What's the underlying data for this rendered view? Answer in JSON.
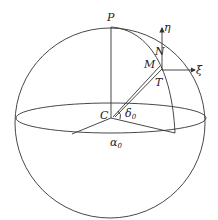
{
  "labels": {
    "pole": "P",
    "center": "C",
    "north_point": "N",
    "m_point": "M",
    "tangent_point": "T",
    "eta_axis": "η",
    "xi_axis": "ξ",
    "delta": "δ",
    "delta_sub": "0",
    "alpha": "α",
    "alpha_sub": "0"
  },
  "colors": {
    "stroke": "#333333",
    "text": "#222222",
    "background": "#ffffff"
  }
}
